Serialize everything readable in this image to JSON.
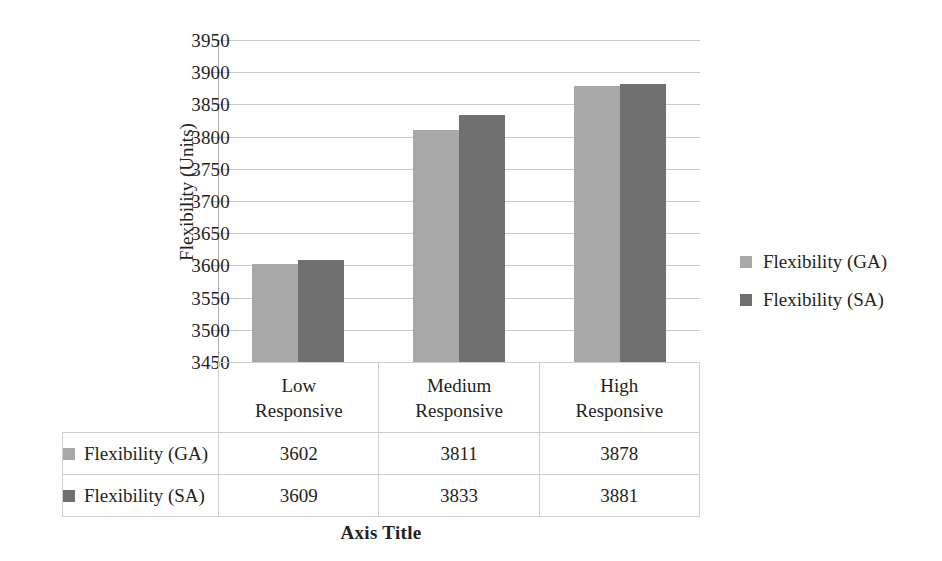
{
  "chart_data": {
    "type": "bar",
    "title": "",
    "xlabel": "Axis Title",
    "ylabel": "Flexibility (Units)",
    "categories": [
      "Low Responsive",
      "Medium Responsive",
      "High Responsive"
    ],
    "category_lines": [
      [
        "Low",
        "Responsive"
      ],
      [
        "Medium",
        "Responsive"
      ],
      [
        "High",
        "Responsive"
      ]
    ],
    "series": [
      {
        "name": "Flexibility (GA)",
        "values": [
          3602,
          3811,
          3878
        ],
        "color": "#a8a8a8"
      },
      {
        "name": "Flexibility (SA)",
        "values": [
          3609,
          3833,
          3881
        ],
        "color": "#707070"
      }
    ],
    "ylim": [
      3450,
      3950
    ],
    "ytick_step": 50,
    "ytick_labels": [
      "3950",
      "3900",
      "3850",
      "3800",
      "3750",
      "3700",
      "3650",
      "3600",
      "3550",
      "3500",
      "3450"
    ],
    "grid": true,
    "legend_position": "right",
    "has_data_table": true
  },
  "legend": {
    "items": [
      {
        "label": "Flexibility (GA)",
        "color": "#a8a8a8"
      },
      {
        "label": "Flexibility (SA)",
        "color": "#707070"
      }
    ]
  },
  "data_table": {
    "column_headers": [
      "Low Responsive",
      "Medium Responsive",
      "High Responsive"
    ],
    "rows": [
      {
        "label": "Flexibility (GA)",
        "color": "#a8a8a8",
        "values": [
          "3602",
          "3811",
          "3878"
        ]
      },
      {
        "label": "Flexibility (SA)",
        "color": "#707070",
        "values": [
          "3609",
          "3833",
          "3881"
        ]
      }
    ]
  },
  "axes": {
    "x_title": "Axis Title",
    "y_title": "Flexibility (Units)"
  },
  "colors": {
    "series_ga": "#a8a8a8",
    "series_sa": "#707070",
    "gridline": "#c9c9c9",
    "table_border": "#cfcfcf",
    "text": "#231f20",
    "background": "#ffffff"
  }
}
